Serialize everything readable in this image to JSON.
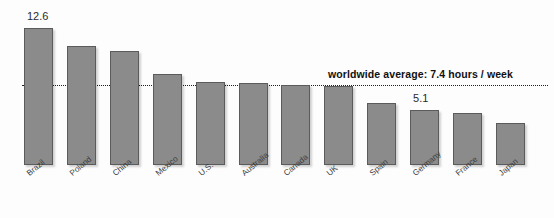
{
  "chart_data": {
    "type": "bar",
    "title": "",
    "subtitle": "",
    "xlabel": "",
    "ylabel": "",
    "ylim": [
      0,
      12.6
    ],
    "grid": false,
    "legend_position": "none",
    "categories": [
      "Brazil",
      "Poland",
      "China",
      "Mexico",
      "U.S.",
      "Australia",
      "Canada",
      "UK",
      "Spain",
      "Germany",
      "France",
      "Japan"
    ],
    "values": [
      12.6,
      10.9,
      10.5,
      8.4,
      7.6,
      7.5,
      7.4,
      7.3,
      5.7,
      5.1,
      4.8,
      3.9
    ],
    "units": "hours / week",
    "data_labels": [
      {
        "category": "Brazil",
        "text": "12.6"
      },
      {
        "category": "Germany",
        "text": "5.1"
      }
    ],
    "annotations": [
      {
        "name": "worldwide-average",
        "text": "worldwide average: 7.4 hours / week",
        "value": 7.4,
        "style": "dotted-reference-line"
      }
    ],
    "colors": {
      "bar_fill": "#8b8b8b",
      "bar_border": "#5b5b5b",
      "annotation_line": "#1e1e1e",
      "background": "#fdfdfd",
      "label_text": "#3a3a3a"
    }
  }
}
